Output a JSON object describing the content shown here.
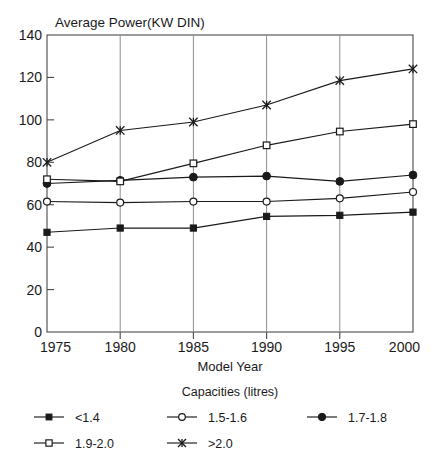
{
  "chart_data": {
    "type": "line",
    "title": "Average Power(KW DIN)",
    "xlabel": "Model Year",
    "ylabel": "",
    "x": [
      1975,
      1980,
      1985,
      1990,
      1995,
      2000
    ],
    "xticklabels": [
      "1975",
      "1980",
      "1985",
      "1990",
      "1995",
      "2000"
    ],
    "yticklabels": [
      "0",
      "20",
      "40",
      "60",
      "80",
      "100",
      "120",
      "140"
    ],
    "yticks": [
      0,
      20,
      40,
      60,
      80,
      100,
      120,
      140
    ],
    "xlim": [
      1975,
      2000
    ],
    "ylim": [
      0,
      140
    ],
    "grid": "vertical",
    "legend_position": "bottom",
    "legend_title": "Capacities (litres)",
    "series": [
      {
        "name": "<1.4",
        "marker": "filled-square",
        "values": [
          47,
          49,
          49,
          54.5,
          55,
          56.5
        ]
      },
      {
        "name": "1.5-1.6",
        "marker": "open-circle",
        "values": [
          61.5,
          61,
          61.5,
          61.5,
          63,
          66
        ]
      },
      {
        "name": "1.7-1.8",
        "marker": "filled-circle",
        "values": [
          70,
          71.5,
          73,
          73.5,
          71,
          74
        ]
      },
      {
        "name": "1.9-2.0",
        "marker": "open-square",
        "values": [
          72,
          71,
          79.5,
          88,
          94.5,
          98
        ]
      },
      {
        "name": ">2.0",
        "marker": "cross",
        "values": [
          80,
          95,
          99,
          107,
          118.5,
          124
        ]
      }
    ]
  },
  "legend": {
    "title": "Capacities (litres)",
    "entries": [
      {
        "label": "<1.4",
        "marker": "filled-square"
      },
      {
        "label": "1.5-1.6",
        "marker": "open-circle"
      },
      {
        "label": "1.7-1.8",
        "marker": "filled-circle"
      },
      {
        "label": "1.9-2.0",
        "marker": "open-square"
      },
      {
        "label": ">2.0",
        "marker": "cross"
      }
    ]
  },
  "colors": {
    "ink": "#1a1a1a",
    "frame": "#4a4a4a",
    "grid": "#8f8f8f",
    "background": "#ffffff"
  }
}
